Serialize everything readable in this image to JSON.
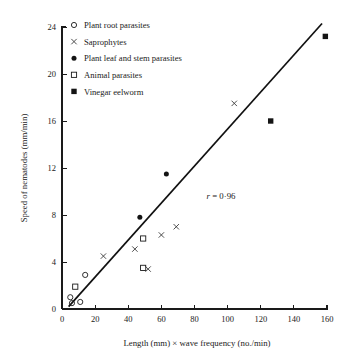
{
  "chart_data": {
    "type": "scatter",
    "title": "",
    "xlabel": "Length (mm) × wave frequency (no./min)",
    "ylabel": "Speed of nematodes (mm/min)",
    "xlim": [
      0,
      160
    ],
    "ylim": [
      0,
      24
    ],
    "xticks": [
      0,
      20,
      40,
      60,
      80,
      100,
      120,
      140,
      160
    ],
    "yticks": [
      0,
      4,
      8,
      12,
      16,
      20,
      24
    ],
    "xtick_labels": [
      "0",
      "20",
      "40",
      "60",
      "80",
      "100",
      "120",
      "140",
      "160"
    ],
    "ytick_labels": [
      "0",
      "4",
      "8",
      "12",
      "16",
      "20",
      "24"
    ],
    "grid": false,
    "legend_position": "upper-left",
    "annotations": [
      {
        "text": "r = 0·96",
        "italic_prefix": "r",
        "rest": " = 0·96",
        "x": 96,
        "y": 9.4
      }
    ],
    "trendline": {
      "label": "regression line",
      "x_start": 4,
      "y_start": 0.2,
      "x_end": 157,
      "y_end": 24.3
    },
    "series": [
      {
        "name": "Plant root parasites",
        "marker": "open-circle",
        "points": [
          {
            "x": 5,
            "y": 1.0
          },
          {
            "x": 6,
            "y": 0.5
          },
          {
            "x": 11,
            "y": 0.6
          },
          {
            "x": 14,
            "y": 2.9
          }
        ]
      },
      {
        "name": "Saprophytes",
        "marker": "cross",
        "points": [
          {
            "x": 25,
            "y": 4.5
          },
          {
            "x": 44,
            "y": 5.1
          },
          {
            "x": 52,
            "y": 3.4
          },
          {
            "x": 60,
            "y": 6.3
          },
          {
            "x": 69,
            "y": 7.0
          },
          {
            "x": 104,
            "y": 17.5
          }
        ]
      },
      {
        "name": "Plant leaf and stem parasites",
        "marker": "filled-circle",
        "points": [
          {
            "x": 47,
            "y": 7.8
          },
          {
            "x": 63,
            "y": 11.5
          }
        ]
      },
      {
        "name": "Animal parasites",
        "marker": "open-square",
        "points": [
          {
            "x": 8,
            "y": 1.9
          },
          {
            "x": 49,
            "y": 6.0
          },
          {
            "x": 49,
            "y": 3.5
          }
        ]
      },
      {
        "name": "Vinegar eelworm",
        "marker": "filled-square",
        "points": [
          {
            "x": 126,
            "y": 16.0
          },
          {
            "x": 159,
            "y": 23.2
          }
        ]
      }
    ]
  },
  "legend": {
    "entries": [
      {
        "label": "Plant root parasites",
        "marker": "open-circle"
      },
      {
        "label": "Saprophytes",
        "marker": "cross"
      },
      {
        "label": "Plant leaf and stem parasites",
        "marker": "filled-circle"
      },
      {
        "label": "Animal parasites",
        "marker": "open-square"
      },
      {
        "label": "Vinegar eelworm",
        "marker": "filled-square"
      }
    ]
  }
}
